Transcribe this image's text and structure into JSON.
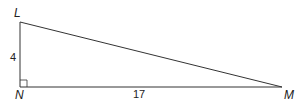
{
  "diagram": {
    "type": "right-triangle",
    "vertices": {
      "L": {
        "label": "L",
        "x": 20,
        "y": 22
      },
      "N": {
        "label": "N",
        "x": 20,
        "y": 87
      },
      "M": {
        "label": "M",
        "x": 282,
        "y": 87
      }
    },
    "sides": {
      "LN": {
        "label": "4"
      },
      "NM": {
        "label": "17"
      }
    },
    "right_angle_at": "N",
    "stroke_color": "#333333"
  }
}
